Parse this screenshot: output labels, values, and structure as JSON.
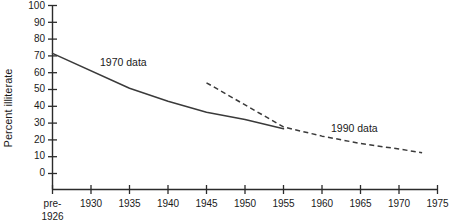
{
  "chart_data": {
    "type": "line",
    "title": "",
    "xlabel": "",
    "ylabel": "Percent illiterate",
    "ylim": [
      0,
      100
    ],
    "ytick_step": 10,
    "grid": false,
    "legend_position": "inline-annotations",
    "categories": [
      "pre-1926",
      "1930",
      "1935",
      "1940",
      "1945",
      "1950",
      "1955",
      "1960",
      "1965",
      "1970",
      "1975"
    ],
    "yticks": [
      "0",
      "10",
      "20",
      "30",
      "40",
      "50",
      "60",
      "70",
      "80",
      "90",
      "100"
    ],
    "xtick_labels_line1": [
      "pre-",
      "1930",
      "1935",
      "1940",
      "1945",
      "1950",
      "1955",
      "1960",
      "1965",
      "1970",
      "1975"
    ],
    "xtick_label_second_line": "1926",
    "series": [
      {
        "name": "1970 data",
        "style": "solid",
        "annotation": "1970 data",
        "points": [
          {
            "x": "pre-1926",
            "y": 74
          },
          {
            "x": "1935",
            "y": 55
          },
          {
            "x": "1940",
            "y": 48
          },
          {
            "x": "1945",
            "y": 42
          },
          {
            "x": "1950",
            "y": 38
          },
          {
            "x": "1955",
            "y": 33
          }
        ]
      },
      {
        "name": "1990 data",
        "style": "dashed",
        "annotation": "1990 data",
        "points": [
          {
            "x": "1945",
            "y": 58
          },
          {
            "x": "1955",
            "y": 34
          },
          {
            "x": "1960",
            "y": 29
          },
          {
            "x": "1965",
            "y": 25
          },
          {
            "x": "1970",
            "y": 22
          },
          {
            "x": "1973",
            "y": 20
          }
        ]
      }
    ],
    "annotations": [
      {
        "text": "1970 data",
        "near_x": "1931",
        "near_y": 66
      },
      {
        "text": "1990 data",
        "near_x": "1962",
        "near_y": 37
      }
    ]
  },
  "colors": {
    "axis": "#2b2b2b",
    "series": "#3a3a3a",
    "background": "#ffffff",
    "text": "#1a1a1a"
  }
}
